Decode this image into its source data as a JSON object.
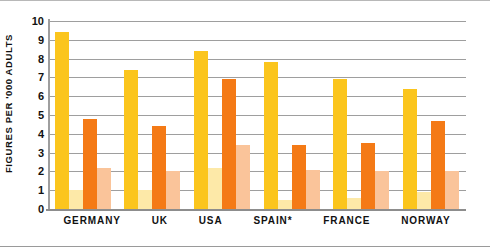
{
  "chart_data": {
    "type": "bar",
    "title": "",
    "subtitle": "",
    "xlabel": "",
    "ylabel": "FIGURES PER '000 ADULTS",
    "ylim": [
      0,
      10
    ],
    "ytick_labels": [
      "10",
      "9",
      "8",
      "7",
      "6",
      "5",
      "4",
      "3",
      "2",
      "1",
      "0"
    ],
    "yticks": [
      10,
      9,
      8,
      7,
      6,
      5,
      4,
      3,
      2,
      1,
      0
    ],
    "grid": "horizontal",
    "legend": "none",
    "categories": [
      "GERMANY",
      "UK",
      "USA",
      "SPAIN*",
      "FRANCE",
      "NORWAY"
    ],
    "annotations": [
      "* denotes footnote marker on SPAIN"
    ],
    "series": [
      {
        "name": "series-1",
        "color": "#FBC51D",
        "values": [
          9.4,
          7.4,
          8.4,
          7.8,
          6.9,
          6.4
        ]
      },
      {
        "name": "series-2",
        "color": "#FDE9A8",
        "values": [
          1.0,
          1.0,
          2.2,
          0.5,
          0.6,
          0.9
        ]
      },
      {
        "name": "series-3",
        "color": "#F47A16",
        "values": [
          4.8,
          4.4,
          6.9,
          3.4,
          3.5,
          4.7
        ]
      },
      {
        "name": "series-4",
        "color": "#FAC49A",
        "values": [
          2.2,
          2.0,
          3.4,
          2.1,
          2.0,
          2.0
        ]
      }
    ]
  },
  "colors": {
    "series_1": "#FBC51D",
    "series_2": "#FDE9A8",
    "series_3": "#F47A16",
    "series_4": "#FAC49A",
    "gridline": "#9e9e9e",
    "axis": "#8d8d8d",
    "text": "#111111",
    "background": "#ffffff"
  }
}
